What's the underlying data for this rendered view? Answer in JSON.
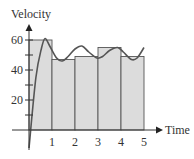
{
  "chart_data": {
    "type": "bar",
    "title": "",
    "xlabel": "Time",
    "ylabel": "Velocity",
    "x_ticks": [
      "1",
      "2",
      "3",
      "4",
      "5"
    ],
    "y_ticks": [
      "20",
      "40",
      "60"
    ],
    "y_minor_ticks": [
      10,
      30,
      50
    ],
    "xlim": [
      0,
      5
    ],
    "ylim": [
      0,
      70
    ],
    "grid": false,
    "categories": [
      "0-1",
      "1-2",
      "2-3",
      "3-4",
      "4-5"
    ],
    "bar_edges": [
      0,
      1,
      2,
      3,
      4,
      5
    ],
    "values": [
      60,
      47,
      49,
      55,
      49
    ],
    "curve": {
      "name": "velocity curve",
      "points": [
        [
          0,
          -12
        ],
        [
          0.3,
          35
        ],
        [
          0.55,
          55
        ],
        [
          0.7,
          61
        ],
        [
          0.9,
          56
        ],
        [
          1.2,
          48
        ],
        [
          1.45,
          46
        ],
        [
          1.7,
          49
        ],
        [
          2.0,
          54
        ],
        [
          2.3,
          56
        ],
        [
          2.6,
          52
        ],
        [
          2.95,
          48
        ],
        [
          3.2,
          49
        ],
        [
          3.5,
          53
        ],
        [
          3.85,
          55
        ],
        [
          4.1,
          52
        ],
        [
          4.45,
          47
        ],
        [
          4.7,
          48
        ],
        [
          5.0,
          55
        ]
      ]
    },
    "colors": {
      "bar_fill": "#dcdcdc",
      "bar_edge": "#555555",
      "curve": "#555555",
      "axis": "#333333"
    }
  },
  "axes": {
    "x_label": "Time",
    "y_label": "Velocity"
  }
}
